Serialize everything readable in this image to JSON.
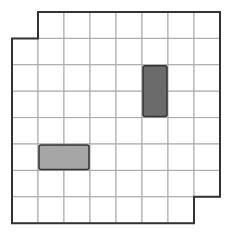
{
  "puzzle": {
    "cols": 8,
    "rows": 8,
    "origin_x": 12,
    "origin_y": 12,
    "cell_w": 26,
    "cell_h": 26.4,
    "missing_cells": [
      [
        0,
        0
      ],
      [
        7,
        7
      ]
    ],
    "blocks": [
      {
        "name": "vertical-dark-block",
        "col": 5,
        "row": 2,
        "w": 1,
        "h": 2,
        "color": "#6b6b6b"
      },
      {
        "name": "horizontal-light-block",
        "col": 1,
        "row": 5,
        "w": 2,
        "h": 1,
        "color": "#a6a6a6"
      }
    ],
    "colors": {
      "grid_line": "#a8a8a8",
      "border": "#333333",
      "background": "#ffffff"
    }
  }
}
